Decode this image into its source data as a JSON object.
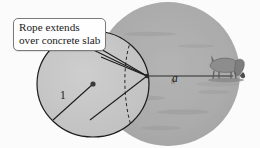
{
  "figure": {
    "title_alt": "Goat tethered to circular concrete slab",
    "callout": {
      "line1": "Rope extends",
      "line2": "over concrete slab"
    },
    "labels": {
      "radius": "1",
      "rope": "a"
    },
    "colors": {
      "background": "#fbfbfb",
      "slab_fill": "#c9c9c9",
      "graze_fill": "#aeaeae",
      "outline": "#1d1d1d",
      "dashed": "#2a2a2a",
      "animal": "#8a8a8a",
      "callout_border": "#7a7a7a",
      "callout_fill": "#fefefe"
    },
    "geometry": {
      "slab_center": [
        93,
        84
      ],
      "slab_radius_x": 56,
      "slab_radius_y": 53,
      "graze_center": [
        168,
        74
      ],
      "graze_radius": 72,
      "tether_point": [
        147,
        76
      ],
      "rope_end": [
        233,
        76
      ]
    },
    "elements": {
      "slab_name": "concrete-slab-circle",
      "graze_name": "grazing-region-circle",
      "center_dot_name": "slab-center-dot",
      "radius_line_name": "radius-line",
      "rope_line_name": "rope-segment",
      "animal_name": "grazing-goat"
    }
  }
}
